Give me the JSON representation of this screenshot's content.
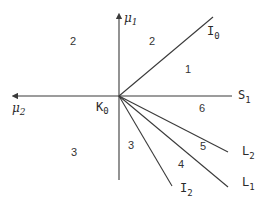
{
  "diagram": {
    "origin": {
      "label": "K",
      "subscript": "0",
      "x": 119,
      "y": 96
    },
    "axes": {
      "vertical": {
        "label": "μ",
        "subscript": "1",
        "direction": "up"
      },
      "horizontal_left": {
        "label": "μ",
        "subscript": "2",
        "direction": "left"
      },
      "horizontal_right": {
        "label": "S",
        "subscript": "1"
      }
    },
    "rays": [
      {
        "id": "I0",
        "label": "I",
        "subscript": "0",
        "end": [
          213,
          17
        ]
      },
      {
        "id": "L2",
        "label": "L",
        "subscript": "2",
        "end": [
          228,
          152
        ]
      },
      {
        "id": "L1",
        "label": "L",
        "subscript": "1",
        "end": [
          228,
          187
        ]
      },
      {
        "id": "I2",
        "label": "I",
        "subscript": "2",
        "end": [
          172,
          186
        ]
      }
    ],
    "regions": [
      {
        "label": "2",
        "x": 73,
        "y": 45
      },
      {
        "label": "2",
        "x": 152,
        "y": 45
      },
      {
        "label": "1",
        "x": 188,
        "y": 73
      },
      {
        "label": "6",
        "x": 201,
        "y": 112
      },
      {
        "label": "5",
        "x": 202,
        "y": 150
      },
      {
        "label": "4",
        "x": 180,
        "y": 168
      },
      {
        "label": "3",
        "x": 133,
        "y": 149
      },
      {
        "label": "3",
        "x": 74,
        "y": 156
      }
    ],
    "colors": {
      "stroke": "#3a3a3a",
      "text": "#2a2a2a",
      "background": "#ffffff"
    }
  }
}
